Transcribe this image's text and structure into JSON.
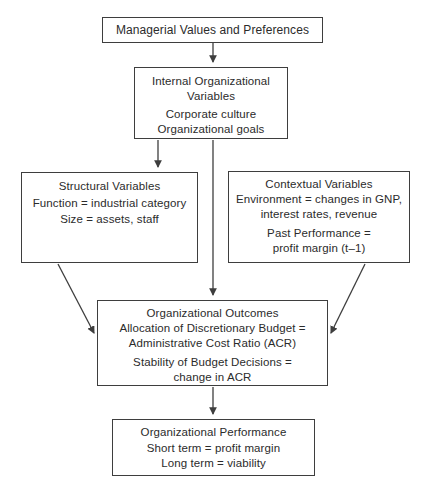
{
  "diagram": {
    "colors": {
      "background": "#ffffff",
      "box_border": "#3e3e3e",
      "arrow": "#3e3e3e",
      "text": "#2b2b2b"
    },
    "boxes": {
      "managerial_values": {
        "line1": "Managerial Values and Preferences"
      },
      "internal_org": {
        "title_line1": "Internal Organizational",
        "title_line2": "Variables",
        "body_line1": "Corporate culture",
        "body_line2": "Organizational goals"
      },
      "structural": {
        "title": "Structural Variables",
        "body_line1": "Function = industrial category",
        "body_line2": "Size = assets, staff"
      },
      "contextual": {
        "title": "Contextual Variables",
        "body_line1": "Environment = changes in GNP,",
        "body_line2": "interest rates, revenue",
        "body_line3": "Past Performance =",
        "body_line4": "profit margin (t–1)"
      },
      "outcomes": {
        "title": "Organizational Outcomes",
        "body_line1": "Allocation of Discretionary Budget =",
        "body_line2": "Administrative Cost Ratio (ACR)",
        "body_line3": "Stability of Budget Decisions =",
        "body_line4": "change in ACR"
      },
      "performance": {
        "title": "Organizational Performance",
        "body_line1": "Short term = profit margin",
        "body_line2": "Long term = viability"
      }
    },
    "connections": [
      "managerial-values -> internal-org",
      "internal-org -> structural",
      "internal-org -> outcomes",
      "structural -> outcomes",
      "contextual -> outcomes",
      "outcomes -> performance"
    ]
  }
}
